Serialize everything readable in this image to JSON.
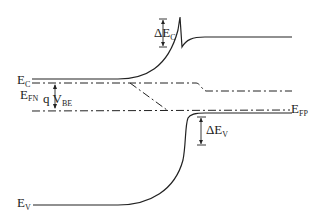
{
  "diagram": {
    "title": "",
    "labels": {
      "ec": {
        "main": "E",
        "sub": "C"
      },
      "efn": {
        "main": "E",
        "sub": "FN"
      },
      "qvbe": {
        "main": "q V",
        "sub": "BE"
      },
      "efp": {
        "main": "E",
        "sub": "FP"
      },
      "ev": {
        "main": "E",
        "sub": "V"
      },
      "delta_ec": {
        "main": "ΔE",
        "sub": "C"
      },
      "delta_ev": {
        "main": "ΔE",
        "sub": "V"
      }
    },
    "colors": {
      "line": "#222222",
      "background": "#ffffff"
    }
  }
}
